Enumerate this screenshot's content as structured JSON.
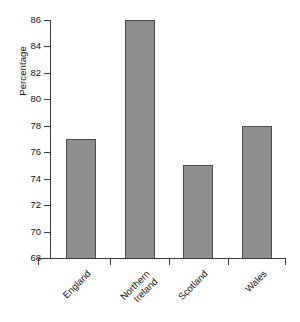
{
  "chart_data": {
    "type": "bar",
    "title": "",
    "subtitle": "",
    "xlabel": "",
    "ylabel": "Percentage",
    "categories": [
      "England",
      "Northern Ireland",
      "Scotland",
      "Wales"
    ],
    "values": [
      77,
      86,
      75,
      78
    ],
    "ylim": [
      68,
      86
    ],
    "ytick_labels": [
      "86",
      "84",
      "82",
      "80",
      "78",
      "76",
      "74",
      "72",
      "70",
      "68"
    ],
    "ytick_values": [
      86,
      84,
      82,
      80,
      78,
      76,
      74,
      72,
      70,
      68
    ],
    "ytick_step": 2,
    "grid": false,
    "legend": false,
    "legend_position": "none",
    "bar_color": "#8f8f8f",
    "bar_border_color": "#4a4a4a",
    "axis_color": "#3a3a3a",
    "background_color": "#ffffff",
    "category_label_rotation": -45,
    "category_labels_multiline": [
      [
        "England"
      ],
      [
        "Northern",
        "Ireland"
      ],
      [
        "Scotland"
      ],
      [
        "Wales"
      ]
    ]
  }
}
